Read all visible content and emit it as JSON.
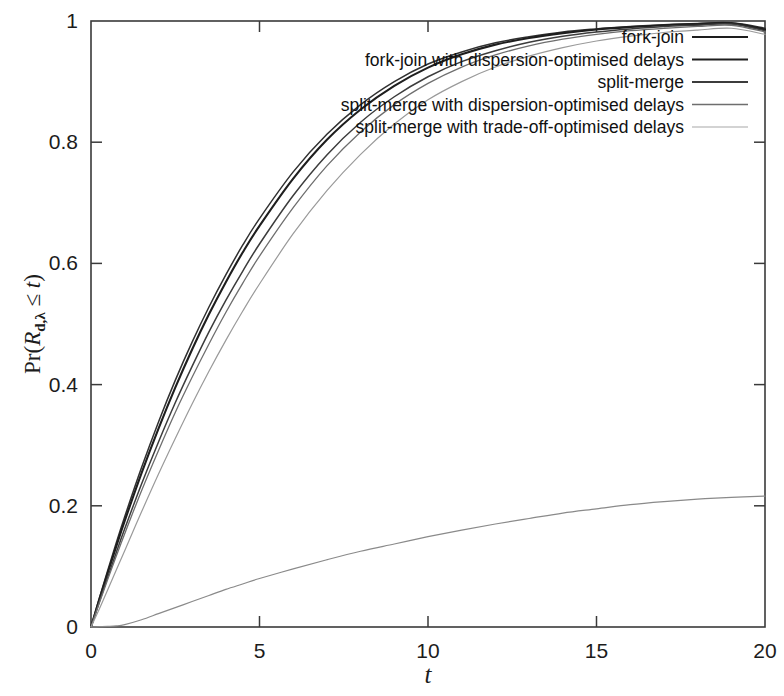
{
  "chart_data": {
    "type": "line",
    "title": "",
    "xlabel": "t",
    "ylabel": "Pr(R_{d,λ} ≤ t)",
    "ylabel_display": "Pr(R",
    "xlim": [
      0,
      20
    ],
    "ylim": [
      0,
      1
    ],
    "grid": false,
    "legend_position": "top-right",
    "xticks": [
      0,
      5,
      10,
      15,
      20
    ],
    "xtick_labels": [
      "0",
      "5",
      "10",
      "15",
      "20"
    ],
    "yticks": [
      0,
      0.2,
      0.4,
      0.6,
      0.8,
      1
    ],
    "ytick_labels": [
      "0",
      "0.2",
      "0.4",
      "0.6",
      "0.8",
      "1"
    ],
    "x": [
      0,
      0.25,
      0.5,
      0.75,
      1,
      1.5,
      2,
      2.5,
      3,
      3.5,
      4,
      4.5,
      5,
      6,
      7,
      8,
      9,
      10,
      11,
      12,
      13,
      14,
      15,
      16,
      17,
      18,
      19,
      20
    ],
    "series": [
      {
        "name": "fork-join",
        "color": "#303030",
        "width": 1.5,
        "values": [
          0,
          0.048,
          0.094,
          0.139,
          0.182,
          0.263,
          0.338,
          0.407,
          0.47,
          0.528,
          0.581,
          0.63,
          0.674,
          0.751,
          0.813,
          0.862,
          0.9,
          0.929,
          0.949,
          0.964,
          0.974,
          0.982,
          0.987,
          0.991,
          0.994,
          0.996,
          0.997,
          0.988
        ]
      },
      {
        "name": "fork-join with dispersion-optimised delays",
        "color": "#1e1e1e",
        "width": 2.1,
        "values": [
          0,
          0.046,
          0.09,
          0.133,
          0.175,
          0.254,
          0.327,
          0.395,
          0.458,
          0.516,
          0.569,
          0.618,
          0.662,
          0.74,
          0.804,
          0.854,
          0.893,
          0.923,
          0.945,
          0.961,
          0.972,
          0.98,
          0.986,
          0.99,
          0.993,
          0.995,
          0.996,
          0.986
        ]
      },
      {
        "name": "split-merge",
        "color": "#3c3c3c",
        "width": 1.5,
        "values": [
          0,
          0.042,
          0.083,
          0.123,
          0.162,
          0.236,
          0.305,
          0.37,
          0.43,
          0.487,
          0.539,
          0.587,
          0.632,
          0.712,
          0.779,
          0.833,
          0.875,
          0.908,
          0.933,
          0.951,
          0.965,
          0.975,
          0.982,
          0.987,
          0.991,
          0.993,
          0.995,
          0.984
        ]
      },
      {
        "name": "split-merge with dispersion-optimised delays",
        "color": "#6e6e6e",
        "width": 1.3,
        "values": [
          0,
          0.04,
          0.079,
          0.117,
          0.154,
          0.225,
          0.291,
          0.354,
          0.412,
          0.467,
          0.519,
          0.567,
          0.612,
          0.692,
          0.761,
          0.817,
          0.862,
          0.897,
          0.924,
          0.944,
          0.959,
          0.97,
          0.978,
          0.984,
          0.988,
          0.991,
          0.993,
          0.982
        ]
      },
      {
        "name": "split-merge with trade-off-optimised delays",
        "color": "#9a9a9a",
        "width": 1.2,
        "values": [
          0,
          0.03,
          0.062,
          0.094,
          0.126,
          0.19,
          0.252,
          0.311,
          0.368,
          0.422,
          0.473,
          0.521,
          0.566,
          0.649,
          0.72,
          0.78,
          0.83,
          0.87,
          0.9,
          0.924,
          0.942,
          0.956,
          0.967,
          0.975,
          0.981,
          0.985,
          0.988,
          0.978
        ]
      },
      {
        "name": "trade-off-slow",
        "color": "#8a8a8a",
        "width": 1.2,
        "values": [
          0,
          0.0005,
          0.001,
          0.0018,
          0.004,
          0.012,
          0.022,
          0.032,
          0.042,
          0.052,
          0.062,
          0.071,
          0.08,
          0.096,
          0.111,
          0.125,
          0.137,
          0.149,
          0.16,
          0.17,
          0.179,
          0.188,
          0.195,
          0.202,
          0.207,
          0.211,
          0.214,
          0.216
        ]
      }
    ]
  },
  "axis": {
    "y_label_parts": {
      "pr": "Pr(",
      "r": "R",
      "sub": "d,λ",
      "rel": " ≤ ",
      "t": "t",
      "close": ")"
    },
    "x_label": "t"
  },
  "legend": {
    "entries": [
      {
        "label": "fork-join",
        "color": "#1e1e1e",
        "width": 2.1
      },
      {
        "label": "fork-join with dispersion-optimised delays",
        "color": "#1e1e1e",
        "width": 2.1
      },
      {
        "label": "split-merge",
        "color": "#3c3c3c",
        "width": 1.8
      },
      {
        "label": "split-merge with dispersion-optimised delays",
        "color": "#6e6e6e",
        "width": 1.4
      },
      {
        "label": "split-merge with trade-off-optimised delays",
        "color": "#a8a8a8",
        "width": 1.2
      }
    ]
  }
}
